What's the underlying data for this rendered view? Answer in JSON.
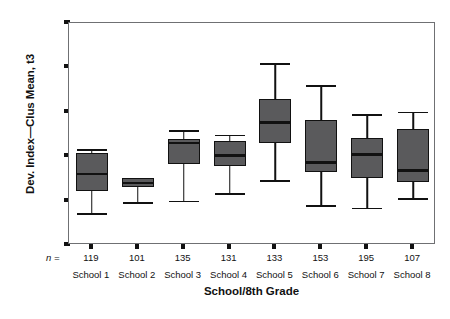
{
  "chart_data": {
    "type": "box",
    "title": "",
    "xlabel": "School/8th Grade",
    "ylabel": "Dev. Index—Clus Mean, t3",
    "ylim": [
      -1.0,
      1.5
    ],
    "ytick_labels": [
      "1.5",
      "1.0",
      "0.5",
      "0.0",
      "-.05",
      "-1.0"
    ],
    "ytick_values": [
      1.5,
      1.0,
      0.5,
      0.0,
      -0.5,
      -1.0
    ],
    "grid": false,
    "legend": null,
    "categories": [
      "School 1",
      "School 2",
      "School 3",
      "School 4",
      "School 5",
      "School 6",
      "School 7",
      "School 8"
    ],
    "n_label": "n =",
    "n_values": [
      119,
      101,
      135,
      131,
      133,
      153,
      195,
      107
    ],
    "box_color": "#5a5a5c",
    "line_color": "#111111",
    "frame_color": "#6f7073",
    "boxes": [
      {
        "category": "School 1",
        "n": 119,
        "whisker_low": -0.64,
        "q1": -0.39,
        "median": -0.2,
        "q3": 0.04,
        "whisker_high": 0.08
      },
      {
        "category": "School 2",
        "n": 101,
        "whisker_low": -0.52,
        "q1": -0.35,
        "median": -0.3,
        "q3": -0.24,
        "whisker_high": -0.24
      },
      {
        "category": "School 3",
        "n": 135,
        "whisker_low": -0.5,
        "q1": -0.09,
        "median": 0.15,
        "q3": 0.19,
        "whisker_high": 0.29
      },
      {
        "category": "School 4",
        "n": 131,
        "whisker_low": -0.42,
        "q1": -0.11,
        "median": 0.01,
        "q3": 0.17,
        "whisker_high": 0.24
      },
      {
        "category": "School 5",
        "n": 133,
        "whisker_low": -0.27,
        "q1": 0.15,
        "median": 0.38,
        "q3": 0.64,
        "whisker_high": 1.05
      },
      {
        "category": "School 6",
        "n": 153,
        "whisker_low": -0.55,
        "q1": -0.18,
        "median": -0.07,
        "q3": 0.41,
        "whisker_high": 0.8
      },
      {
        "category": "School 7",
        "n": 195,
        "whisker_low": -0.58,
        "q1": -0.24,
        "median": 0.02,
        "q3": 0.2,
        "whisker_high": 0.47
      },
      {
        "category": "School 8",
        "n": 107,
        "whisker_low": -0.47,
        "q1": -0.29,
        "median": -0.16,
        "q3": 0.31,
        "whisker_high": 0.5
      }
    ]
  },
  "caption": {
    "text": ""
  }
}
